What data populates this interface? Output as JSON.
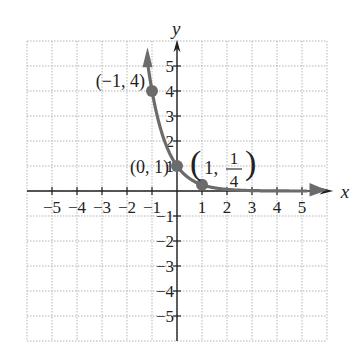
{
  "chart_data": {
    "type": "line",
    "title": "",
    "function": "y = (1/4)^x",
    "xlabel": "x",
    "ylabel": "y",
    "xlim": [
      -6,
      6
    ],
    "ylim": [
      -6,
      6
    ],
    "grid": true,
    "x_ticks": [
      -5,
      -4,
      -3,
      -2,
      -1,
      1,
      2,
      3,
      4,
      5
    ],
    "y_ticks": [
      -5,
      -4,
      -3,
      -2,
      -1,
      1,
      2,
      3,
      4,
      5
    ],
    "x_tick_labels": [
      "−5",
      "−4",
      "−3",
      "−2",
      "−1",
      "1",
      "2",
      "3",
      "4",
      "5"
    ],
    "y_tick_labels": [
      "−5",
      "−4",
      "−3",
      "−2",
      "−1",
      "1",
      "2",
      "3",
      "4",
      "5"
    ],
    "series": [
      {
        "name": "curve",
        "x": [
          -1.15,
          -1,
          -0.5,
          0,
          0.5,
          1,
          2,
          3,
          4,
          5.2
        ],
        "y": [
          4.93,
          4,
          2,
          1,
          0.5,
          0.25,
          0.0625,
          0.0156,
          0.0039,
          0.0007
        ],
        "color": "#6b6b6b"
      }
    ],
    "points": [
      {
        "x": -1,
        "y": 4,
        "label": "(−1, 4)"
      },
      {
        "x": 0,
        "y": 1,
        "label": "(0, 1)"
      },
      {
        "x": 1,
        "y": 0.25,
        "label_left": "(1, ",
        "label_num": "1",
        "label_den": "4",
        "label_right": ")"
      }
    ],
    "colors": {
      "curve": "#6b6b6b",
      "axis": "#222222",
      "grid": "#b5b5b5"
    }
  }
}
